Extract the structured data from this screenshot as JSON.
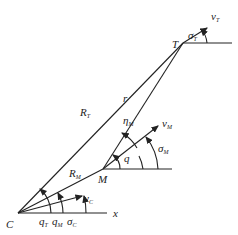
{
  "diagram": {
    "points": {
      "C": {
        "label": "C",
        "x": 18,
        "y": 213
      },
      "M": {
        "label": "M",
        "x": 103,
        "y": 169
      },
      "T": {
        "label": "T",
        "x": 183,
        "y": 43
      }
    },
    "lines": {
      "RT": {
        "label": "R",
        "sub": "T"
      },
      "RM": {
        "label": "R",
        "sub": "M"
      },
      "r": {
        "label": "r"
      }
    },
    "vectors": {
      "vT": {
        "label": "v",
        "sub": "T"
      },
      "vM": {
        "label": "v",
        "sub": "M"
      },
      "vC": {
        "label": "v",
        "sub": "C"
      }
    },
    "angles": {
      "sigmaT": {
        "label": "σ",
        "sub": "T"
      },
      "sigmaM": {
        "label": "σ",
        "sub": "M"
      },
      "sigmaC": {
        "label": "σ",
        "sub": "C"
      },
      "etaM": {
        "label": "η",
        "sub": "M"
      },
      "q": {
        "label": "q"
      },
      "qT": {
        "label": "q",
        "sub": "T"
      },
      "qM": {
        "label": "q",
        "sub": "M"
      }
    },
    "axis": {
      "label": "x"
    },
    "colors": {
      "stroke": "#222222",
      "background": "#ffffff"
    }
  }
}
